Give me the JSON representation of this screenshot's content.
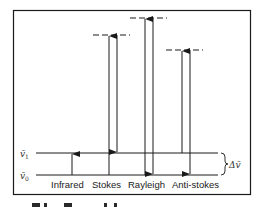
{
  "diagram": {
    "type": "energy-level-diagram",
    "topic": "Infrared and Raman scattering transitions",
    "colors": {
      "line": "#1a1a1a",
      "frame": "#1a1a1a",
      "background": "#ffffff"
    },
    "levels": {
      "v0": {
        "label": "ṽ",
        "subscript": "0",
        "y": 175
      },
      "v1": {
        "label": "ṽ",
        "subscript": "1",
        "y": 153
      }
    },
    "delta_label": "Δṽ",
    "virtual_levels": [
      {
        "name": "stokes-virtual",
        "y": 35,
        "x1": 93,
        "x2": 130
      },
      {
        "name": "rayleigh-virtual",
        "y": 18,
        "x1": 130,
        "x2": 166
      },
      {
        "name": "anti-stokes-virtual",
        "y": 50,
        "x1": 166,
        "x2": 203
      }
    ],
    "transitions": [
      {
        "label": "Infrared",
        "up": {
          "x": 72,
          "from": "v0",
          "to": "v1"
        }
      },
      {
        "label": "Stokes",
        "up": {
          "x": 109,
          "from": "v0",
          "to": "virtual"
        },
        "down": {
          "x": 117,
          "from": "virtual",
          "to": "v1"
        }
      },
      {
        "label": "Rayleigh",
        "up": {
          "x": 145,
          "from": "v0",
          "to": "virtual"
        },
        "down": {
          "x": 153,
          "from": "virtual",
          "to": "v0"
        }
      },
      {
        "label": "Anti-stokes",
        "up": {
          "x": 182,
          "from": "v1",
          "to": "virtual"
        },
        "down": {
          "x": 190,
          "from": "virtual",
          "to": "v0"
        }
      }
    ],
    "labels": {
      "infrared": "Infrared",
      "stokes": "Stokes",
      "rayleigh": "Rayleigh",
      "anti_stokes": "Anti-stokes",
      "v0_symbol": "ṽ",
      "v0_sub": "0",
      "v1_symbol": "ṽ",
      "v1_sub": "1",
      "delta": "Δṽ"
    }
  }
}
